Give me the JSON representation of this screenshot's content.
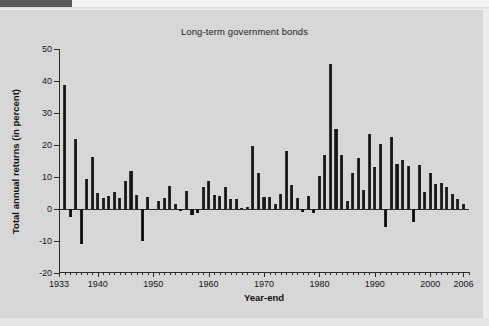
{
  "chart_data": {
    "type": "bar",
    "title": "Long-term government bonds",
    "xlabel": "Year-end",
    "ylabel": "Total annual returns (in percent)",
    "ylim": [
      -20,
      50
    ],
    "yticks": [
      50,
      40,
      30,
      20,
      10,
      0,
      -10,
      -20
    ],
    "ytick_labels": [
      "50",
      "40",
      "30",
      "20",
      "10",
      "0",
      "-10",
      "-20"
    ],
    "xlim": [
      1933,
      2007
    ],
    "xticks": [
      1933,
      1940,
      1950,
      1960,
      1970,
      1980,
      1990,
      2000,
      2006
    ],
    "xtick_labels": [
      "1933",
      "1940",
      "1950",
      "1960",
      "1970",
      "1980",
      "1990",
      "2000",
      "2006"
    ],
    "grid": false,
    "legend": false,
    "bar_color": "#1a1a1a",
    "background_color": "#d7d7d7",
    "x": [
      1934,
      1935,
      1936,
      1937,
      1938,
      1939,
      1940,
      1941,
      1942,
      1943,
      1944,
      1945,
      1946,
      1947,
      1948,
      1949,
      1950,
      1951,
      1952,
      1953,
      1954,
      1955,
      1956,
      1957,
      1958,
      1959,
      1960,
      1961,
      1962,
      1963,
      1964,
      1965,
      1966,
      1967,
      1968,
      1969,
      1970,
      1971,
      1972,
      1973,
      1974,
      1975,
      1976,
      1977,
      1978,
      1979,
      1980,
      1981,
      1982,
      1983,
      1984,
      1985,
      1986,
      1987,
      1988,
      1989,
      1990,
      1991,
      1992,
      1993,
      1994,
      1995,
      1996,
      1997,
      1998,
      1999,
      2000,
      2001,
      2002,
      2003,
      2004,
      2005,
      2006
    ],
    "categories": [
      "1934",
      "1935",
      "1936",
      "1937",
      "1938",
      "1939",
      "1940",
      "1941",
      "1942",
      "1943",
      "1944",
      "1945",
      "1946",
      "1947",
      "1948",
      "1949",
      "1950",
      "1951",
      "1952",
      "1953",
      "1954",
      "1955",
      "1956",
      "1957",
      "1958",
      "1959",
      "1960",
      "1961",
      "1962",
      "1963",
      "1964",
      "1965",
      "1966",
      "1967",
      "1968",
      "1969",
      "1970",
      "1971",
      "1972",
      "1973",
      "1974",
      "1975",
      "1976",
      "1977",
      "1978",
      "1979",
      "1980",
      "1981",
      "1982",
      "1983",
      "1984",
      "1985",
      "1986",
      "1987",
      "1988",
      "1989",
      "1990",
      "1991",
      "1992",
      "1993",
      "1994",
      "1995",
      "1996",
      "1997",
      "1998",
      "1999",
      "2000",
      "2001",
      "2002",
      "2003",
      "2004",
      "2005",
      "2006"
    ],
    "values": [
      38.9,
      -2.6,
      22.0,
      -10.8,
      9.3,
      16.2,
      5.1,
      3.4,
      4.0,
      5.4,
      3.5,
      8.9,
      11.8,
      4.3,
      -10.0,
      3.8,
      -0.4,
      2.6,
      3.3,
      7.2,
      1.5,
      -0.6,
      5.7,
      -1.9,
      -1.2,
      6.8,
      8.6,
      4.3,
      4.1,
      6.9,
      3.1,
      3.2,
      0.4,
      0.6,
      19.6,
      11.1,
      3.6,
      3.8,
      1.7,
      4.6,
      18.2,
      7.4,
      3.3,
      -1.0,
      4.1,
      -1.2,
      10.4,
      16.8,
      45.3,
      24.9,
      16.9,
      2.6,
      11.2,
      15.9,
      6.0,
      23.3,
      13.1,
      20.4,
      -5.5,
      22.5,
      14.2,
      15.4,
      13.4,
      -4.1,
      13.7,
      5.3,
      11.2,
      7.7,
      8.1,
      6.9,
      4.7,
      3.0,
      1.6
    ]
  },
  "page": {
    "title": "Long-term government bonds",
    "axis_x_title": "Year-end",
    "axis_y_title": "Total annual returns (in percent)"
  }
}
